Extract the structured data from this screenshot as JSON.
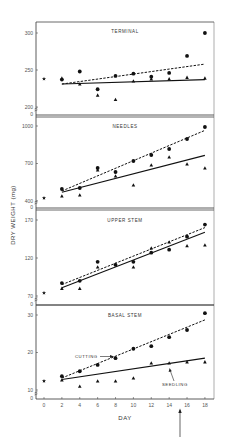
{
  "chart_data": {
    "type": "scatter",
    "title": "",
    "xlabel": "DAY",
    "ylabel": "DRY WEIGHT (mg)",
    "x": [
      0,
      2,
      4,
      6,
      8,
      10,
      12,
      14,
      16,
      18
    ],
    "xticks": [
      "0",
      "2",
      "4",
      "6",
      "8",
      "10",
      "12",
      "14",
      "16",
      "18"
    ],
    "xlim": [
      0,
      18
    ],
    "grid": false,
    "legend": {
      "position": "annotated arrows in BASAL STEM panel",
      "entries": [
        "CUTTING",
        "SEEDLING"
      ]
    },
    "markers": {
      "initial": "star",
      "cutting": "filled circle",
      "seedling": "filled triangle"
    },
    "line_styles": {
      "cutting": "dashed",
      "seedling": "solid"
    },
    "annotations": [
      "arrow below x-axis at day ~15"
    ],
    "panels": [
      {
        "title": "TERMINAL",
        "yticks": [
          "200",
          "250",
          "300"
        ],
        "ylim": [
          200,
          300
        ],
        "initial": {
          "x": 0,
          "y": 238
        },
        "series": [
          {
            "name": "CUTTING",
            "x": [
              2,
              4,
              6,
              8,
              10,
              12,
              14,
              16,
              18
            ],
            "values": [
              237,
              248,
              224,
              242,
              245,
              241,
              246,
              269,
              300
            ],
            "fit": [
              [
                2,
                231
              ],
              [
                18,
                258
              ]
            ]
          },
          {
            "name": "SEEDLING",
            "x": [
              2,
              4,
              6,
              8,
              10,
              12,
              14,
              16,
              18
            ],
            "values": [
              239,
              231,
              216,
              210,
              235,
              238,
              238,
              240,
              239
            ],
            "fit": [
              [
                2,
                231
              ],
              [
                18,
                237
              ]
            ]
          }
        ]
      },
      {
        "title": "NEEDLES",
        "yticks": [
          "400",
          "700",
          "1000"
        ],
        "ylim": [
          400,
          1000
        ],
        "initial": {
          "x": 0,
          "y": 424
        },
        "series": [
          {
            "name": "CUTTING",
            "x": [
              2,
              4,
              6,
              8,
              10,
              12,
              14,
              16,
              18
            ],
            "values": [
              496,
              504,
              664,
              632,
              720,
              768,
              816,
              896,
              992
            ],
            "fit": [
              [
                2,
                480
              ],
              [
                18,
                965
              ]
            ]
          },
          {
            "name": "SEEDLING",
            "x": [
              2,
              4,
              6,
              8,
              10,
              12,
              14,
              16,
              18
            ],
            "values": [
              440,
              448,
              648,
              600,
              528,
              688,
              752,
              696,
              664
            ],
            "fit": [
              [
                2,
                470
              ],
              [
                18,
                765
              ]
            ]
          }
        ]
      },
      {
        "title": "UPPER STEM",
        "yticks": [
          "70",
          "120",
          "170"
        ],
        "ylim": [
          70,
          170
        ],
        "initial": {
          "x": 0,
          "y": 74
        },
        "series": [
          {
            "name": "CUTTING",
            "x": [
              2,
              4,
              6,
              8,
              10,
              12,
              14,
              16,
              18
            ],
            "values": [
              87,
              90,
              115,
              111,
              115,
              127,
              131,
              148,
              164
            ],
            "fit": [
              [
                2,
                85
              ],
              [
                18,
                160
              ]
            ]
          },
          {
            "name": "SEEDLING",
            "x": [
              2,
              4,
              6,
              8,
              10,
              12,
              14,
              16,
              18
            ],
            "values": [
              80,
              80,
              108,
              112,
              108,
              133,
              141,
              136,
              137
            ],
            "fit": [
              [
                2,
                81
              ],
              [
                18,
                154
              ]
            ]
          }
        ]
      },
      {
        "title": "BASAL STEM",
        "yticks": [
          "10",
          "20",
          "30"
        ],
        "ylim": [
          10,
          30
        ],
        "initial": {
          "x": 0,
          "y": 12.4
        },
        "series": [
          {
            "name": "CUTTING",
            "x": [
              2,
              4,
              6,
              8,
              10,
              12,
              14,
              16,
              18
            ],
            "values": [
              13.7,
              15.0,
              16.7,
              18.5,
              21.0,
              21.7,
              24.1,
              26.0,
              30.5
            ],
            "fit": [
              [
                2,
                13.2
              ],
              [
                18,
                28.7
              ]
            ]
          },
          {
            "name": "SEEDLING",
            "x": [
              2,
              4,
              6,
              8,
              10,
              12,
              14,
              16,
              18
            ],
            "values": [
              12.7,
              11.0,
              12.4,
              12.4,
              13.2,
              17.2,
              17.2,
              17.5,
              17.5
            ],
            "fit": [
              [
                2,
                12.8
              ],
              [
                18,
                18.5
              ]
            ]
          }
        ]
      }
    ]
  },
  "labels": {
    "ylabel": "DRY WEIGHT (mg)",
    "xlabel": "DAY",
    "cutting": "CUTTING",
    "seedling": "SEEDLING",
    "zero": "0"
  }
}
